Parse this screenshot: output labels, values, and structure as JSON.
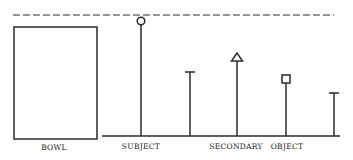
{
  "diagram": {
    "labels": {
      "bowl": "BOWL",
      "subject": "SUBJECT",
      "secondary": "SECONDARY",
      "object": "OBJECT"
    },
    "colors": {
      "stroke": "#2a2a2a",
      "background": "#ffffff"
    },
    "elements": [
      {
        "name": "bowl",
        "shape": "rectangle"
      },
      {
        "name": "subject",
        "marker": "circle"
      },
      {
        "name": "secondary-marker-1",
        "marker": "t-bar"
      },
      {
        "name": "secondary",
        "marker": "triangle"
      },
      {
        "name": "object",
        "marker": "square"
      },
      {
        "name": "object-marker-2",
        "marker": "t-bar"
      }
    ],
    "reference_line": "dashed"
  }
}
